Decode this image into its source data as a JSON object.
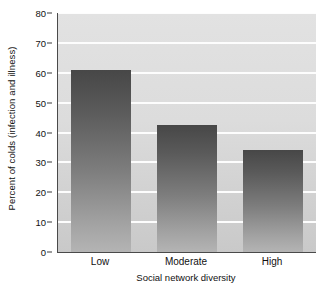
{
  "chart_data": {
    "type": "bar",
    "title": "",
    "xlabel": "Social network diversity",
    "ylabel": "Percent of colds (infection and illness)",
    "categories": [
      "Low",
      "Moderate",
      "High"
    ],
    "values": [
      61,
      42.5,
      34
    ],
    "series": [
      {
        "name": "Percent of colds (infection and illness)",
        "values": [
          61,
          42.5,
          34
        ]
      }
    ],
    "ylim": [
      0,
      80
    ],
    "ytick_interval": 10,
    "yticks": [
      "0",
      "10",
      "20",
      "30",
      "40",
      "50",
      "60",
      "70",
      "80"
    ],
    "grid": "horizontal",
    "legend": "none",
    "colors": {
      "bar_top": "#474747",
      "bar_bottom": "#b4b4b4",
      "plot_background_top": "#e2e2e2",
      "plot_background_bottom": "#c9c9c9",
      "gridline": "#fdfdfd",
      "axis": "#4a4a4a",
      "text": "#111111"
    }
  }
}
